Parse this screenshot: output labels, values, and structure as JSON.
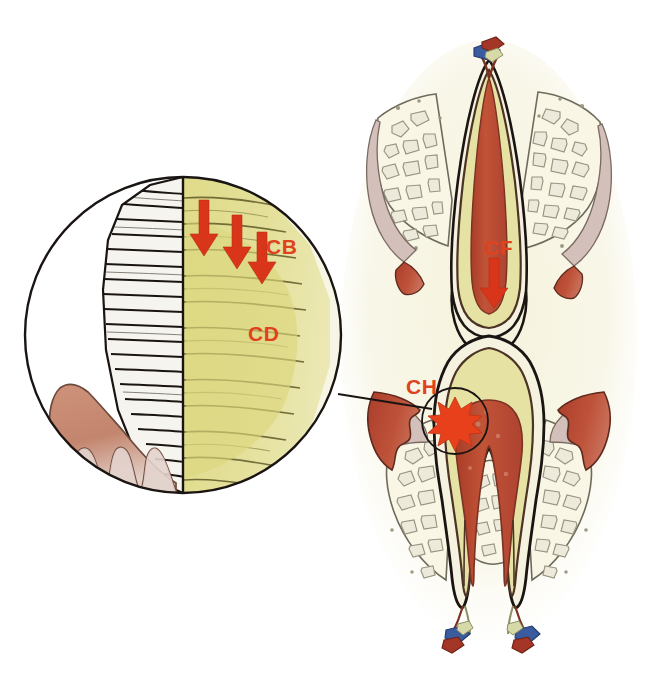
{
  "figure": {
    "background_color": "#ffffff",
    "width": 656,
    "height": 674
  },
  "palette": {
    "label_red": "#E0421E",
    "arrow_red": "#D8351A",
    "starburst_red": "#E8401B",
    "pulp_red": "#BD4B33",
    "gingiva_red": "#B4452F",
    "gingiva_pink": "#C98C74",
    "dentin_yellow": "#E2DE92",
    "dentin_yellow_deep": "#D9D377",
    "enamel_white": "#F4F2EC",
    "bone_cream": "#F7F4E4",
    "bone_outline": "#8C8A7A",
    "outline_dark": "#1A1512",
    "outline_brown": "#4B3326",
    "halo_tint": "#F2F0DC",
    "vein_blue": "#3A5C9E",
    "artery_red": "#A33626",
    "nerve_cream": "#D8D9A8"
  },
  "magnifier": {
    "name": "magnified-enamel-dentin-circle",
    "center_x": 183,
    "center_y": 335,
    "radius": 158,
    "regions": [
      {
        "id": "enamel",
        "label": "enamel-rod-striations",
        "description": "White enamel with horizontal rod striations",
        "color": "#F4F2EC"
      },
      {
        "id": "dentin",
        "label": "dentin-tubules",
        "description": "Yellow dentin body with radiating tubule lines",
        "color": "#E2DE92"
      },
      {
        "id": "gingiva",
        "label": "gingival-rete-ridges",
        "description": "Pink-brown gingival tissue with wavy rete ridges",
        "color": "#C98C74"
      }
    ]
  },
  "labels": [
    {
      "id": "cb",
      "text": "CB",
      "x": 266,
      "y": 247,
      "color": "#E0421E",
      "description": "Label CB in magnified view near downward arrows"
    },
    {
      "id": "cd",
      "text": "CD",
      "x": 250,
      "y": 334,
      "color": "#E0421E",
      "description": "Label CD in magnified dentin region"
    },
    {
      "id": "cf",
      "text": "CF",
      "x": 487,
      "y": 249,
      "color": "#E0421E",
      "description": "Label CF on upper tooth root with downward arrow"
    },
    {
      "id": "ch",
      "text": "CH",
      "x": 409,
      "y": 387,
      "color": "#E0421E",
      "description": "Label CH at interproximal contact starburst"
    }
  ],
  "arrows": [
    {
      "id": "cb-arrow-1",
      "x": 213,
      "y": 200,
      "height": 58,
      "width": 17,
      "color": "#D8351A"
    },
    {
      "id": "cb-arrow-2",
      "x": 240,
      "y": 215,
      "height": 55,
      "width": 17,
      "color": "#D8351A"
    },
    {
      "id": "cb-arrow-3",
      "x": 262,
      "y": 232,
      "height": 53,
      "width": 17,
      "color": "#D8351A"
    },
    {
      "id": "cf-arrow",
      "x": 494,
      "y": 258,
      "height": 50,
      "width": 19,
      "color": "#D8351A"
    }
  ],
  "markers": [
    {
      "id": "ch-starburst",
      "name": "contact-point-starburst",
      "center_x": 455,
      "center_y": 421,
      "radius": 24,
      "color": "#E8401B",
      "circle_radius": 33
    }
  ],
  "leader_line": {
    "id": "magnifier-leader",
    "from_x": 338,
    "from_y": 394,
    "to_x": 432,
    "to_y": 409
  },
  "anatomy": {
    "upper_tooth": {
      "name": "upper-tooth-inverted-root",
      "description": "Inverted maxillary tooth root with pulp canal and surrounding trabecular bone"
    },
    "lower_tooth": {
      "name": "lower-molar-two-roots",
      "description": "Mandibular molar with two roots, pulp chamber and apical neurovascular bundles"
    },
    "bone": {
      "name": "trabecular-bone",
      "description": "Cancellous bone with irregular trabecular spaces"
    },
    "gingiva": {
      "name": "gingival-tissue",
      "description": "Red scalloped gingival margin tissue"
    }
  }
}
